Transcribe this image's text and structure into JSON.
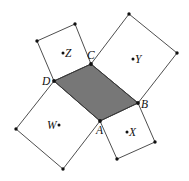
{
  "diagram": {
    "title": "",
    "colors": {
      "parallelogram_fill": "#777777",
      "stroke": "#3a3a3a",
      "vertex": "#111111"
    },
    "parallelogram": {
      "name": "ABCD",
      "vertices": {
        "A": [
          100,
          121
        ],
        "B": [
          138,
          103
        ],
        "C": [
          91,
          64
        ],
        "D": [
          54,
          81
        ]
      }
    },
    "squares": [
      {
        "center_label": "W",
        "side": "DA",
        "points": [
          [
            54,
            81
          ],
          [
            100,
            121
          ],
          [
            63,
            169
          ],
          [
            16,
            129
          ]
        ],
        "center": [
          59,
          125
        ]
      },
      {
        "center_label": "X",
        "side": "AB",
        "points": [
          [
            100,
            121
          ],
          [
            138,
            103
          ],
          [
            155,
            142
          ],
          [
            117,
            159
          ]
        ],
        "center": [
          127,
          132
        ]
      },
      {
        "center_label": "Y",
        "side": "BC",
        "points": [
          [
            138,
            103
          ],
          [
            91,
            64
          ],
          [
            129,
            14
          ],
          [
            177,
            53
          ]
        ],
        "center": [
          133,
          59
        ]
      },
      {
        "center_label": "Z",
        "side": "CD",
        "points": [
          [
            91,
            64
          ],
          [
            54,
            81
          ],
          [
            37,
            41
          ],
          [
            75,
            24
          ]
        ],
        "center": [
          63,
          53
        ]
      }
    ],
    "labels": {
      "A": "A",
      "B": "B",
      "C": "C",
      "D": "D",
      "W": "W",
      "X": "X",
      "Y": "Y",
      "Z": "Z"
    }
  }
}
